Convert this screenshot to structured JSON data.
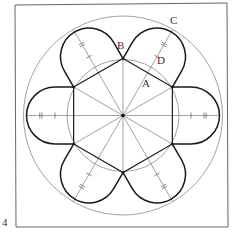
{
  "figure": {
    "number": "4",
    "labels": {
      "A": "A",
      "B": "B",
      "C": "C",
      "D": "D"
    },
    "colors": {
      "outline": "#1a1a1a",
      "construction": "#8a8a8a",
      "frame": "#555555",
      "background": "#ffffff"
    },
    "geometry": {
      "center": [
        123,
        115.5
      ],
      "outer_circle_radius": 99.5,
      "inner_circle_radius": 56,
      "hexagon_circumradius": 57,
      "lobe_count": 6,
      "lobe_cap_radius": 28.5,
      "lobe_cap_center_distance": 68
    }
  }
}
